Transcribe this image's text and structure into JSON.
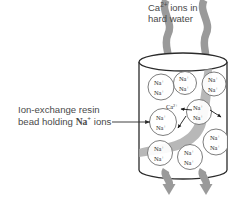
{
  "diagram": {
    "colors": {
      "flow_arrow": "#9a9a9a",
      "flow_band": "#a8a8a8",
      "outline": "#2b2b2b",
      "bead_stroke": "#6e6e6e",
      "text": "#4a4a4a",
      "ion_arrow": "#1a1a1a",
      "background": "#ffffff"
    },
    "captions": {
      "inflow": {
        "line1_main": "Ca",
        "line1_sup": "2+",
        "line1_rest": " ions in",
        "line2": "hard water"
      },
      "bead_label": {
        "line1": "Ion-exchange resin",
        "line2_pre": "bead holding ",
        "line2_ion": "Na",
        "line2_ion_sup": "+",
        "line2_post": " ions"
      }
    },
    "species": {
      "sodium": "Na",
      "sodium_charge": "+",
      "calcium": "Ca",
      "calcium_charge": "2+"
    },
    "cylinder": {
      "label": "ion-exchange column"
    },
    "beads": [
      {
        "id": "bead-1",
        "cx": 161,
        "cy": 87,
        "r": 13.0,
        "ions": 2
      },
      {
        "id": "bead-2",
        "cx": 185,
        "cy": 83,
        "r": 11.5,
        "ions": 2
      },
      {
        "id": "bead-3",
        "cx": 214,
        "cy": 84,
        "r": 12.0,
        "ions": 2
      },
      {
        "id": "bead-4",
        "cx": 163,
        "cy": 122,
        "r": 13.5,
        "ions": 2
      },
      {
        "id": "bead-5",
        "cx": 199,
        "cy": 112,
        "r": 12.5,
        "ions": 2
      },
      {
        "id": "bead-6",
        "cx": 216,
        "cy": 142,
        "r": 13.0,
        "ions": 2
      },
      {
        "id": "bead-7",
        "cx": 160,
        "cy": 153,
        "r": 12.5,
        "ions": 2
      },
      {
        "id": "bead-8",
        "cx": 190,
        "cy": 157,
        "r": 12.5,
        "ions": 2
      }
    ],
    "free_calcium": {
      "id": "free-ca-ion",
      "x": 172,
      "y": 107
    },
    "flow_arrows_in": [
      {
        "id": "inflow-arrow-left",
        "x": 168
      },
      {
        "id": "inflow-arrow-right",
        "x": 205
      }
    ],
    "flow_arrows_out": [
      {
        "id": "outflow-arrow-left",
        "x": 169
      },
      {
        "id": "outflow-arrow-right",
        "x": 206
      }
    ],
    "ion_release_arrows": [
      {
        "id": "na-release-arrow-up-left"
      },
      {
        "id": "na-release-arrow-down"
      },
      {
        "id": "na-release-arrow-right"
      }
    ]
  }
}
